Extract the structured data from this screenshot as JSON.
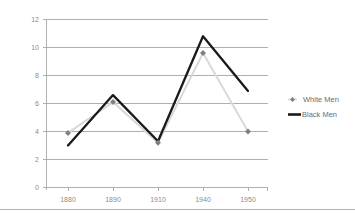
{
  "chart_data": {
    "type": "line",
    "title": "",
    "xlabel": "",
    "ylabel": "",
    "categories": [
      "1880",
      "1890",
      "1910",
      "1940",
      "1950"
    ],
    "x_tick_labels": [
      "1880",
      "1890",
      "1910",
      "1940",
      "1950"
    ],
    "y_tick_labels": [
      "0",
      "2",
      "4",
      "6",
      "8",
      "10",
      "12"
    ],
    "y_ticks": [
      0,
      2,
      4,
      6,
      8,
      10,
      12
    ],
    "ylim": [
      0,
      12
    ],
    "grid": "horizontal",
    "legend_position": "right",
    "series": [
      {
        "name": "White Men",
        "color": "#d9d9d9",
        "marker": "diamond",
        "marker_color": "#808080",
        "values": [
          3.9,
          6.1,
          3.2,
          9.6,
          4.0
        ]
      },
      {
        "name": "Black Men",
        "color": "#1a1a1a",
        "marker": "none",
        "values": [
          3.0,
          6.6,
          3.3,
          10.8,
          6.9
        ]
      }
    ]
  },
  "legend": {
    "items": [
      {
        "label": "White Men",
        "swatch": "line-with-diamond-marker",
        "color": "#d9d9d9"
      },
      {
        "label": "Black Men",
        "swatch": "thick-line",
        "color": "#1a1a1a"
      }
    ]
  },
  "colors": {
    "background": "#ffffff",
    "gridline": "#a6a6a6",
    "tick_text": "#8c8c8c",
    "legend_text": "#6d6d6d",
    "white_men": "#d9d9d9",
    "white_men_marker": "#808080",
    "black_men": "#1a1a1a",
    "bottom_rule": "#b0b0b0"
  }
}
